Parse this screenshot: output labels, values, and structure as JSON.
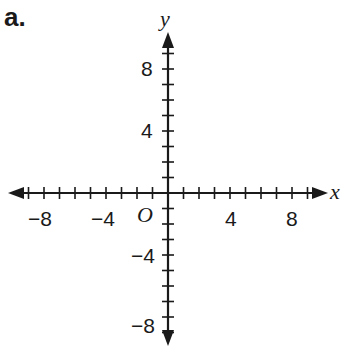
{
  "problem_label": "a.",
  "axes": {
    "x_name": "x",
    "y_name": "y",
    "origin_label": "O",
    "range": [
      -10,
      10
    ],
    "tick_step": 1,
    "x_tick_labels": [
      "−8",
      "−4",
      "4",
      "8"
    ],
    "y_tick_labels": [
      "8",
      "4",
      "−4",
      "−8"
    ]
  },
  "chart_data": {
    "type": "coordinate-plane",
    "title": "a.",
    "xlabel": "x",
    "ylabel": "y",
    "xlim": [
      -10,
      10
    ],
    "ylim": [
      -10,
      10
    ],
    "x_labeled_ticks": [
      -8,
      -4,
      4,
      8
    ],
    "y_labeled_ticks": [
      -8,
      -4,
      4,
      8
    ],
    "origin_label": "O",
    "grid": false
  }
}
